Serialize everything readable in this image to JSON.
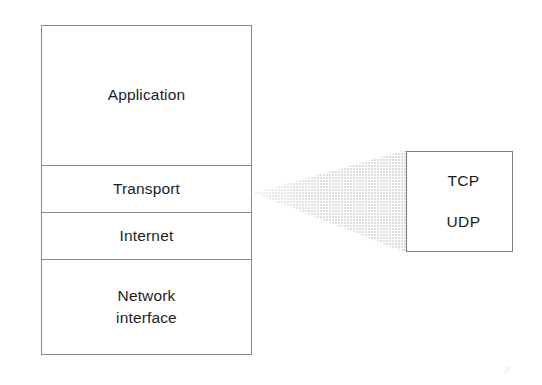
{
  "diagram": {
    "background_color": "#ffffff",
    "border_color": "#8a8a8a",
    "text_color": "#1e1e1e",
    "funnel_fill_color": "#e2e2e2",
    "stack": {
      "name": "TCP/IP protocol stack",
      "layers": [
        {
          "id": "application",
          "label": "Application"
        },
        {
          "id": "transport",
          "label": "Transport"
        },
        {
          "id": "internet",
          "label": "Internet"
        },
        {
          "id": "network-interface",
          "label_line1": "Network",
          "label_line2": "interface"
        }
      ]
    },
    "detail": {
      "source_layer": "Transport",
      "protocols": [
        {
          "id": "tcp",
          "label": "TCP"
        },
        {
          "id": "udp",
          "label": "UDP"
        }
      ]
    },
    "connector": {
      "type": "magnifier-wedge",
      "from": "Transport",
      "to": "TCP/UDP box"
    },
    "artifact": {
      "glyph": "//"
    }
  }
}
